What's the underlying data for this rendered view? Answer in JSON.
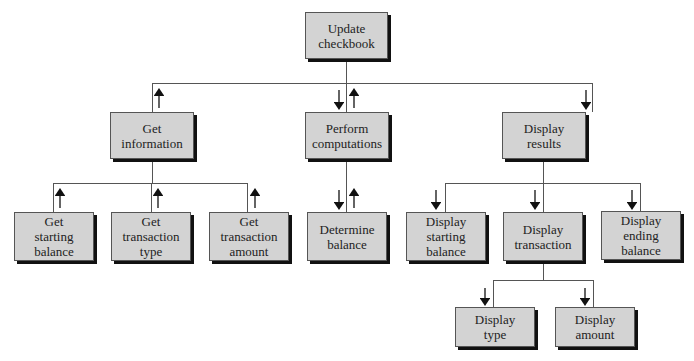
{
  "diagram": {
    "type": "structure-chart",
    "root": {
      "label": "Update\ncheckbook",
      "l1": "Update",
      "l2": "checkbook"
    },
    "level1": [
      {
        "l1": "Get",
        "l2": "information",
        "flow": "up"
      },
      {
        "l1": "Perform",
        "l2": "computations",
        "flow": "down-up"
      },
      {
        "l1": "Display",
        "l2": "results",
        "flow": "down"
      }
    ],
    "level2": [
      {
        "l1": "Get",
        "l2": "starting",
        "l3": "balance",
        "parent": "Get information",
        "flow": "up"
      },
      {
        "l1": "Get",
        "l2": "transaction",
        "l3": "type",
        "parent": "Get information",
        "flow": "up"
      },
      {
        "l1": "Get",
        "l2": "transaction",
        "l3": "amount",
        "parent": "Get information",
        "flow": "up"
      },
      {
        "l1": "Determine",
        "l2": "balance",
        "parent": "Perform computations",
        "flow": "down-up"
      },
      {
        "l1": "Display",
        "l2": "starting",
        "l3": "balance",
        "parent": "Display results",
        "flow": "down"
      },
      {
        "l1": "Display",
        "l2": "transaction",
        "parent": "Display results",
        "flow": "down"
      },
      {
        "l1": "Display",
        "l2": "ending",
        "l3": "balance",
        "parent": "Display results",
        "flow": "down"
      }
    ],
    "level3": [
      {
        "l1": "Display",
        "l2": "type",
        "parent": "Display transaction",
        "flow": "down"
      },
      {
        "l1": "Display",
        "l2": "amount",
        "parent": "Display transaction",
        "flow": "down"
      }
    ]
  }
}
